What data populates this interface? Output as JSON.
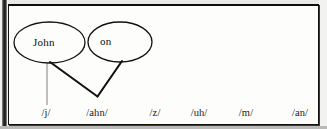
{
  "figure": {
    "type": "phoneme-mapping-diagram",
    "words": [
      {
        "id": "word-john",
        "label": "John",
        "cx": 49.5,
        "cy": 42.5,
        "rx": 35.5,
        "ry": 20.5,
        "text_x": 33,
        "text_y": 36
      },
      {
        "id": "word-on",
        "label": "on",
        "cx": 120,
        "cy": 42,
        "rx": 32,
        "ry": 20,
        "text_x": 100,
        "text_y": 35
      }
    ],
    "phonemes": [
      {
        "label": "/j/",
        "x": 46
      },
      {
        "label": "/ahn/",
        "x": 97
      },
      {
        "label": "/z/",
        "x": 155
      },
      {
        "label": "/uh/",
        "x": 199
      },
      {
        "label": "/m/",
        "x": 246
      },
      {
        "label": "/an/",
        "x": 300
      }
    ],
    "phoneme_row_y": 107,
    "connectors": [
      {
        "name": "john-to-j",
        "from": [
          47,
          63
        ],
        "to": [
          47,
          105
        ],
        "weight": "thin",
        "color": "#8a8a88"
      },
      {
        "name": "john-to-ahn",
        "from": [
          50,
          62
        ],
        "to": [
          97,
          96
        ],
        "weight": "thick",
        "color": "#14110f"
      },
      {
        "name": "on-to-ahn",
        "from": [
          122,
          61
        ],
        "to": [
          97,
          96
        ],
        "weight": "thick",
        "color": "#14110f"
      }
    ],
    "colors": {
      "ink": "#14110f",
      "page": "#fdfdfc",
      "surround": "#f2f2f0",
      "thin_line": "#8a8a88"
    }
  }
}
